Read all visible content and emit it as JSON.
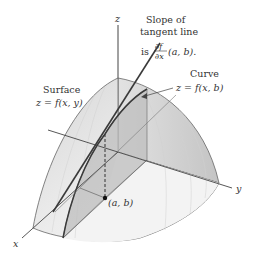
{
  "diagram": {
    "axes": {
      "x_label": "x",
      "y_label": "y",
      "z_label": "z"
    },
    "labels": {
      "surface_title": "Surface",
      "surface_eq": "z = f(x, y)",
      "curve_title": "Curve",
      "curve_eq": "z = f(x, b)",
      "slope_line1": "Slope of",
      "slope_line2": "tangent line",
      "slope_is": "is",
      "slope_frac_num": "∂f",
      "slope_frac_den": "∂x",
      "slope_args": "(a, b).",
      "point_label": "(a, b)"
    },
    "colors": {
      "surface_fill": "#e4e4e4",
      "surface_dark": "#c9c9c9",
      "plane_fill": "#bdbdbd",
      "edge": "#555555",
      "axis": "#444444",
      "tangent": "#3a3a3a"
    }
  }
}
